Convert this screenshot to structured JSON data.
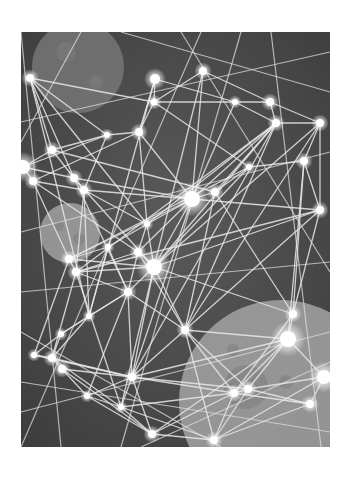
{
  "image": {
    "subject": "abstract network constellation over planets",
    "style": "grayscale illustration",
    "frame": {
      "x": 21,
      "y": 32,
      "width": 309,
      "height": 415
    },
    "colors": {
      "page_background": "#ffffff",
      "space_background": "#474747",
      "space_background_light": "#5a5a5a",
      "line": "#e6e6e6",
      "node": "#ffffff",
      "node_glow": "#ffffff",
      "planet_top_left": "#7a7a7a",
      "planet_mid_left": "#a8a8a8",
      "planet_bottom_right": "#a0a0a0",
      "crater": "#7e7e7e"
    }
  },
  "planets": [
    {
      "name": "planet-top-left",
      "cx": 57,
      "cy": 35,
      "r": 46,
      "fill": "#767676",
      "opacity": 0.85,
      "craters": [
        {
          "cx": 45,
          "cy": 20,
          "r": 10
        },
        {
          "cx": 75,
          "cy": 50,
          "r": 7
        }
      ]
    },
    {
      "name": "planet-mid-left",
      "cx": 49,
      "cy": 201,
      "r": 30,
      "fill": "#a6a6a6",
      "opacity": 0.8,
      "craters": [
        {
          "cx": 38,
          "cy": 194,
          "r": 5
        },
        {
          "cx": 58,
          "cy": 207,
          "r": 6
        }
      ]
    },
    {
      "name": "planet-bottom-right",
      "cx": 260,
      "cy": 370,
      "r": 102,
      "fill": "#a3a3a3",
      "opacity": 0.85,
      "craters": [
        {
          "cx": 225,
          "cy": 355,
          "r": 22
        },
        {
          "cx": 265,
          "cy": 350,
          "r": 7
        },
        {
          "cx": 212,
          "cy": 318,
          "r": 6
        }
      ]
    }
  ],
  "nodes": [
    {
      "x": 9,
      "y": 46,
      "r": 4
    },
    {
      "x": 134,
      "y": 47,
      "r": 5
    },
    {
      "x": 182,
      "y": 39,
      "r": 4
    },
    {
      "x": 133,
      "y": 70,
      "r": 3.5
    },
    {
      "x": 118,
      "y": 100,
      "r": 4
    },
    {
      "x": 86,
      "y": 103,
      "r": 3
    },
    {
      "x": 214,
      "y": 70,
      "r": 3
    },
    {
      "x": 249,
      "y": 70,
      "r": 4
    },
    {
      "x": 255,
      "y": 91,
      "r": 4
    },
    {
      "x": 299,
      "y": 91,
      "r": 4
    },
    {
      "x": 31,
      "y": 118,
      "r": 4
    },
    {
      "x": 2,
      "y": 135,
      "r": 7
    },
    {
      "x": 12,
      "y": 149,
      "r": 4
    },
    {
      "x": 53,
      "y": 146,
      "r": 4
    },
    {
      "x": 63,
      "y": 158,
      "r": 4
    },
    {
      "x": 171,
      "y": 167,
      "r": 8
    },
    {
      "x": 194,
      "y": 160,
      "r": 4
    },
    {
      "x": 228,
      "y": 135,
      "r": 3
    },
    {
      "x": 283,
      "y": 129,
      "r": 4
    },
    {
      "x": 299,
      "y": 178,
      "r": 4
    },
    {
      "x": 126,
      "y": 192,
      "r": 3
    },
    {
      "x": 48,
      "y": 227,
      "r": 4
    },
    {
      "x": 55,
      "y": 240,
      "r": 4
    },
    {
      "x": 117,
      "y": 220,
      "r": 4
    },
    {
      "x": 133,
      "y": 235,
      "r": 8
    },
    {
      "x": 87,
      "y": 215,
      "r": 3
    },
    {
      "x": 68,
      "y": 284,
      "r": 3
    },
    {
      "x": 107,
      "y": 260,
      "r": 4
    },
    {
      "x": 272,
      "y": 282,
      "r": 4
    },
    {
      "x": 267,
      "y": 307,
      "r": 8
    },
    {
      "x": 164,
      "y": 298,
      "r": 4
    },
    {
      "x": 13,
      "y": 323,
      "r": 3
    },
    {
      "x": 31,
      "y": 326,
      "r": 4
    },
    {
      "x": 41,
      "y": 337,
      "r": 4
    },
    {
      "x": 111,
      "y": 345,
      "r": 4
    },
    {
      "x": 66,
      "y": 364,
      "r": 3
    },
    {
      "x": 100,
      "y": 375,
      "r": 3
    },
    {
      "x": 213,
      "y": 361,
      "r": 4
    },
    {
      "x": 227,
      "y": 357,
      "r": 4
    },
    {
      "x": 289,
      "y": 372,
      "r": 4
    },
    {
      "x": 303,
      "y": 345,
      "r": 7
    },
    {
      "x": 131,
      "y": 402,
      "r": 4
    },
    {
      "x": 193,
      "y": 408,
      "r": 4
    },
    {
      "x": 40,
      "y": 302,
      "r": 3
    }
  ],
  "edges": [
    [
      0,
      3
    ],
    [
      0,
      5
    ],
    [
      0,
      10
    ],
    [
      0,
      13
    ],
    [
      0,
      26
    ],
    [
      0,
      20
    ],
    [
      1,
      3
    ],
    [
      1,
      6
    ],
    [
      1,
      4
    ],
    [
      1,
      26
    ],
    [
      2,
      3
    ],
    [
      2,
      7
    ],
    [
      2,
      15
    ],
    [
      2,
      24
    ],
    [
      3,
      4
    ],
    [
      3,
      6
    ],
    [
      3,
      17
    ],
    [
      4,
      5
    ],
    [
      4,
      15
    ],
    [
      4,
      12
    ],
    [
      4,
      20
    ],
    [
      5,
      10
    ],
    [
      5,
      14
    ],
    [
      5,
      11
    ],
    [
      6,
      7
    ],
    [
      6,
      8
    ],
    [
      6,
      15
    ],
    [
      7,
      8
    ],
    [
      7,
      9
    ],
    [
      8,
      9
    ],
    [
      8,
      15
    ],
    [
      8,
      16
    ],
    [
      8,
      20
    ],
    [
      8,
      22
    ],
    [
      8,
      24
    ],
    [
      8,
      30
    ],
    [
      8,
      34
    ],
    [
      9,
      18
    ],
    [
      9,
      19
    ],
    [
      9,
      30
    ],
    [
      9,
      24
    ],
    [
      10,
      13
    ],
    [
      10,
      11
    ],
    [
      10,
      16
    ],
    [
      11,
      12
    ],
    [
      11,
      13
    ],
    [
      12,
      14
    ],
    [
      12,
      21
    ],
    [
      12,
      23
    ],
    [
      13,
      14
    ],
    [
      13,
      15
    ],
    [
      13,
      24
    ],
    [
      13,
      27
    ],
    [
      14,
      15
    ],
    [
      14,
      20
    ],
    [
      14,
      22
    ],
    [
      14,
      26
    ],
    [
      15,
      16
    ],
    [
      15,
      20
    ],
    [
      15,
      23
    ],
    [
      15,
      24
    ],
    [
      15,
      21
    ],
    [
      15,
      19
    ],
    [
      15,
      34
    ],
    [
      16,
      17
    ],
    [
      16,
      30
    ],
    [
      16,
      28
    ],
    [
      17,
      18
    ],
    [
      17,
      21
    ],
    [
      17,
      24
    ],
    [
      18,
      19
    ],
    [
      18,
      28
    ],
    [
      18,
      29
    ],
    [
      19,
      28
    ],
    [
      19,
      22
    ],
    [
      19,
      30
    ],
    [
      20,
      23
    ],
    [
      20,
      24
    ],
    [
      20,
      25
    ],
    [
      21,
      22
    ],
    [
      21,
      24
    ],
    [
      21,
      25
    ],
    [
      21,
      31
    ],
    [
      22,
      23
    ],
    [
      22,
      24
    ],
    [
      22,
      27
    ],
    [
      22,
      32
    ],
    [
      22,
      36
    ],
    [
      23,
      24
    ],
    [
      23,
      27
    ],
    [
      23,
      30
    ],
    [
      24,
      27
    ],
    [
      24,
      30
    ],
    [
      24,
      34
    ],
    [
      24,
      28
    ],
    [
      24,
      19
    ],
    [
      24,
      36
    ],
    [
      25,
      26
    ],
    [
      25,
      27
    ],
    [
      26,
      27
    ],
    [
      26,
      32
    ],
    [
      26,
      43
    ],
    [
      27,
      30
    ],
    [
      27,
      34
    ],
    [
      27,
      35
    ],
    [
      28,
      29
    ],
    [
      28,
      37
    ],
    [
      29,
      30
    ],
    [
      29,
      37
    ],
    [
      29,
      38
    ],
    [
      29,
      34
    ],
    [
      29,
      40
    ],
    [
      29,
      41
    ],
    [
      30,
      34
    ],
    [
      30,
      37
    ],
    [
      30,
      42
    ],
    [
      30,
      38
    ],
    [
      31,
      32
    ],
    [
      31,
      43
    ],
    [
      31,
      34
    ],
    [
      32,
      33
    ],
    [
      32,
      34
    ],
    [
      32,
      36
    ],
    [
      33,
      34
    ],
    [
      33,
      35
    ],
    [
      33,
      41
    ],
    [
      34,
      35
    ],
    [
      34,
      36
    ],
    [
      34,
      37
    ],
    [
      34,
      41
    ],
    [
      34,
      38
    ],
    [
      35,
      36
    ],
    [
      35,
      41
    ],
    [
      36,
      37
    ],
    [
      36,
      41
    ],
    [
      36,
      42
    ],
    [
      37,
      38
    ],
    [
      37,
      42
    ],
    [
      37,
      39
    ],
    [
      37,
      41
    ],
    [
      38,
      39
    ],
    [
      38,
      40
    ],
    [
      38,
      42
    ],
    [
      39,
      40
    ],
    [
      39,
      42
    ],
    [
      40,
      42
    ],
    [
      41,
      42
    ],
    [
      43,
      32
    ],
    [
      43,
      27
    ]
  ],
  "stray_lines": [
    [
      0,
      0,
      40,
      415
    ],
    [
      60,
      0,
      0,
      110
    ],
    [
      100,
      0,
      309,
      60
    ],
    [
      160,
      0,
      309,
      240
    ],
    [
      0,
      200,
      309,
      120
    ],
    [
      0,
      260,
      309,
      230
    ],
    [
      0,
      380,
      309,
      300
    ],
    [
      0,
      415,
      180,
      0
    ],
    [
      309,
      330,
      120,
      415
    ],
    [
      0,
      90,
      309,
      20
    ],
    [
      250,
      0,
      300,
      415
    ],
    [
      0,
      300,
      200,
      415
    ],
    [
      309,
      400,
      0,
      350
    ],
    [
      220,
      0,
      100,
      415
    ]
  ]
}
